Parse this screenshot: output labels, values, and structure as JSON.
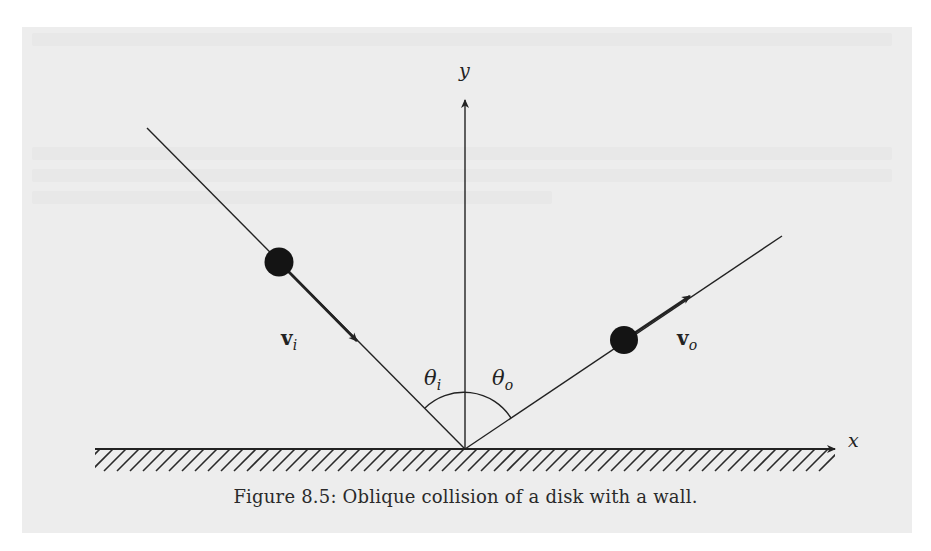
{
  "figure": {
    "caption": "Figure 8.5: Oblique collision of a disk with a wall.",
    "labels": {
      "y_axis": "y",
      "x_axis": "x",
      "v_in_base": "v",
      "v_in_sub": "i",
      "v_out_base": "v",
      "v_out_sub": "o",
      "theta_in_base": "θ",
      "theta_in_sub": "i",
      "theta_out_base": "θ",
      "theta_out_sub": "o"
    },
    "elements": {
      "wall": "hatched horizontal wall along x-axis",
      "incoming_disk": "black disk moving down-right toward origin",
      "outgoing_disk": "black disk moving up-right away from origin",
      "angle_arc": "arc spanning θi and θo about the y-axis"
    },
    "colors": {
      "ink": "#222222",
      "panel_background": "#ededed",
      "page_background": "#ffffff"
    }
  }
}
